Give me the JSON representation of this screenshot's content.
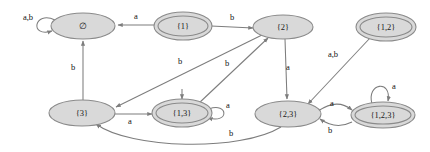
{
  "diagram": {
    "type": "finite-state-automaton",
    "alphabet": [
      "a",
      "b"
    ],
    "colors": {
      "node_fill": "#d9d9d9",
      "node_stroke": "#8a8a8a",
      "edge_stroke": "#7d7d7d",
      "text": "#111111",
      "background": "#ffffff"
    },
    "nodes": [
      {
        "id": "empty",
        "label": "∅",
        "x": 83,
        "y": 26,
        "rx": 32,
        "ry": 13,
        "accepting": false
      },
      {
        "id": "s1",
        "label": "{1}",
        "x": 183,
        "y": 26,
        "rx": 27,
        "ry": 12,
        "accepting": true
      },
      {
        "id": "s2",
        "label": "{2}",
        "x": 283,
        "y": 26,
        "rx": 28,
        "ry": 12,
        "accepting": false
      },
      {
        "id": "s12",
        "label": "{1,2}",
        "x": 386,
        "y": 27,
        "rx": 28,
        "ry": 12,
        "accepting": true
      },
      {
        "id": "s3",
        "label": "{3}",
        "x": 82,
        "y": 113,
        "rx": 32,
        "ry": 13,
        "accepting": false
      },
      {
        "id": "s13",
        "label": "{1,3}",
        "x": 182,
        "y": 113,
        "rx": 28,
        "ry": 12,
        "accepting": true
      },
      {
        "id": "s23",
        "label": "{2,3}",
        "x": 288,
        "y": 114,
        "rx": 32,
        "ry": 13,
        "accepting": false
      },
      {
        "id": "s123",
        "label": "{1,2,3}",
        "x": 383,
        "y": 115,
        "rx": 30,
        "ry": 12,
        "accepting": true
      }
    ],
    "edges": [
      {
        "id": "e-empty-self",
        "from": "empty",
        "to": "empty",
        "label": "a,b",
        "label_x": 28,
        "label_y": 18
      },
      {
        "id": "e-s1-empty",
        "from": "s1",
        "to": "empty",
        "label": "a",
        "label_x": 136,
        "label_y": 18
      },
      {
        "id": "e-s1-s2",
        "from": "s1",
        "to": "s2",
        "label": "b",
        "label_x": 232,
        "label_y": 18
      },
      {
        "id": "e-s3-empty",
        "from": "s3",
        "to": "empty",
        "label": "b",
        "label_x": 73,
        "label_y": 68
      },
      {
        "id": "e-s2-s3",
        "from": "s2",
        "to": "s3",
        "label": "b",
        "label_x": 180,
        "label_y": 62
      },
      {
        "id": "e-s13-s2",
        "from": "s13",
        "to": "s2",
        "label": "b",
        "label_x": 227,
        "label_y": 65
      },
      {
        "id": "e-s2-s23",
        "from": "s2",
        "to": "s23",
        "label": "a",
        "label_x": 287,
        "label_y": 68
      },
      {
        "id": "e-s12-s23",
        "from": "s12",
        "to": "s23",
        "label": "a,b",
        "label_x": 332,
        "label_y": 55
      },
      {
        "id": "e-s3-s13",
        "from": "s3",
        "to": "s13",
        "label": "a",
        "label_x": 130,
        "label_y": 120
      },
      {
        "id": "e-s13-self",
        "from": "s13",
        "to": "s13",
        "label": "a",
        "label_x": 226,
        "label_y": 107
      },
      {
        "id": "e-s23-s123",
        "from": "s23",
        "to": "s123",
        "label": "a",
        "label_x": 332,
        "label_y": 107
      },
      {
        "id": "e-s123-s23",
        "from": "s123",
        "to": "s23",
        "label": "b",
        "label_x": 330,
        "label_y": 130
      },
      {
        "id": "e-s123-self",
        "from": "s123",
        "to": "s123",
        "label": "a",
        "label_x": 393,
        "label_y": 88
      },
      {
        "id": "e-s23-s3",
        "from": "s23",
        "to": "s3",
        "label": "b",
        "label_x": 231,
        "label_y": 133
      },
      {
        "id": "e-into-s13",
        "from": "s1",
        "to": "s13",
        "label": "",
        "label_x": 0,
        "label_y": 0
      }
    ]
  }
}
